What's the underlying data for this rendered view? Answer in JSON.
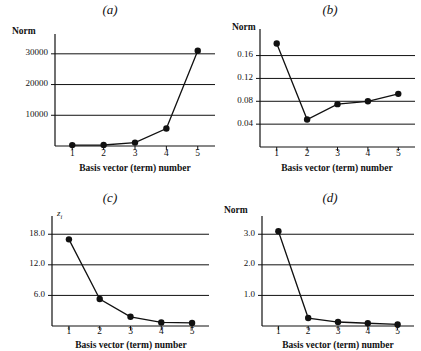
{
  "figure": {
    "background": "#ffffff",
    "ink_color": "#111111",
    "panel_count": 4
  },
  "common": {
    "xlabel": "Basis vector (term) number",
    "xticks": [
      "1",
      "2",
      "3",
      "4",
      "5"
    ],
    "x_values": [
      1,
      2,
      3,
      4,
      5
    ]
  },
  "chart_data": [
    {
      "id": "a",
      "panel_label": "(a)",
      "type": "line",
      "title": "(a)",
      "xlabel": "Basis vector (term) number",
      "ylabel": "Norm",
      "categories": [
        "1",
        "2",
        "3",
        "4",
        "5"
      ],
      "x": [
        1,
        2,
        3,
        4,
        5
      ],
      "values": [
        300,
        320,
        1100,
        5700,
        31000
      ],
      "yticks": [
        "10000",
        "20000",
        "30000"
      ],
      "ytick_values": [
        10000,
        20000,
        30000
      ],
      "ylim": [
        0,
        34500
      ],
      "xlim": [
        0.45,
        5.55
      ],
      "grid": true,
      "legend": "none",
      "markers": "filled-circle"
    },
    {
      "id": "b",
      "panel_label": "(b)",
      "type": "line",
      "title": "(b)",
      "xlabel": "Basis vector (term) number",
      "ylabel": "Norm",
      "categories": [
        "1",
        "2",
        "3",
        "4",
        "5"
      ],
      "x": [
        1,
        2,
        3,
        4,
        5
      ],
      "values": [
        0.181,
        0.048,
        0.075,
        0.08,
        0.093
      ],
      "yticks": [
        "0.04",
        "0.08",
        "0.12",
        "0.16"
      ],
      "ytick_values": [
        0.04,
        0.08,
        0.12,
        0.16
      ],
      "ylim": [
        0.0,
        0.196
      ],
      "xlim": [
        0.45,
        5.55
      ],
      "grid": true,
      "legend": "none",
      "markers": "filled-circle"
    },
    {
      "id": "c",
      "panel_label": "(c)",
      "type": "line",
      "title": "(c)",
      "xlabel": "Basis vector (term) number",
      "ylabel": "z",
      "ylabel_subscript": "i",
      "categories": [
        "1",
        "2",
        "3",
        "4",
        "5"
      ],
      "x": [
        1,
        2,
        3,
        4,
        5
      ],
      "values": [
        17.0,
        5.3,
        1.8,
        0.7,
        0.6
      ],
      "yticks": [
        "6.0",
        "12.0",
        "18.0"
      ],
      "ytick_values": [
        6.0,
        12.0,
        18.0
      ],
      "ylim": [
        0,
        20.4
      ],
      "xlim": [
        0.45,
        5.55
      ],
      "grid": true,
      "legend": "none",
      "markers": "filled-circle"
    },
    {
      "id": "d",
      "panel_label": "(d)",
      "type": "line",
      "title": "(d)",
      "xlabel": "Basis vector (term) number",
      "ylabel": "Norm",
      "categories": [
        "1",
        "2",
        "3",
        "4",
        "5"
      ],
      "x": [
        1,
        2,
        3,
        4,
        5
      ],
      "values": [
        3.1,
        0.26,
        0.13,
        0.09,
        0.05
      ],
      "yticks": [
        "1.0",
        "2.0",
        "3.0"
      ],
      "ytick_values": [
        1.0,
        2.0,
        3.0
      ],
      "ylim": [
        0,
        3.4
      ],
      "xlim": [
        0.45,
        5.55
      ],
      "grid": true,
      "legend": "none",
      "markers": "filled-circle"
    }
  ]
}
